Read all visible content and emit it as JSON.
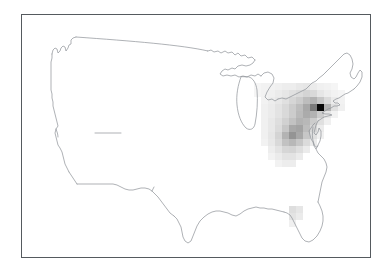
{
  "figure": {
    "title": "",
    "background_color": "#ffffff",
    "frame_color": "#555a5e",
    "outline_color": "#8d9196",
    "width": 389,
    "height": 272
  },
  "map": {
    "region_label": "Contiguous United States",
    "projection": "albers-equal-area",
    "frame": {
      "x": 21,
      "y": 14,
      "width": 350,
      "height": 244
    }
  },
  "chart_data": {
    "type": "heatmap",
    "title": "",
    "subtitle": "",
    "xlabel": "",
    "ylabel": "",
    "grid": false,
    "legend": "none",
    "colormap": "Greys",
    "value_range": [
      0,
      1
    ],
    "cell_size_px": 7,
    "cells": [
      {
        "x": 253,
        "y": 82,
        "v": 0.04
      },
      {
        "x": 260,
        "y": 82,
        "v": 0.05
      },
      {
        "x": 267,
        "y": 82,
        "v": 0.05
      },
      {
        "x": 274,
        "y": 82,
        "v": 0.06
      },
      {
        "x": 281,
        "y": 82,
        "v": 0.07
      },
      {
        "x": 288,
        "y": 82,
        "v": 0.07
      },
      {
        "x": 295,
        "y": 82,
        "v": 0.09
      },
      {
        "x": 302,
        "y": 82,
        "v": 0.1
      },
      {
        "x": 309,
        "y": 82,
        "v": 0.08
      },
      {
        "x": 316,
        "y": 82,
        "v": 0.06
      },
      {
        "x": 323,
        "y": 82,
        "v": 0.05
      },
      {
        "x": 330,
        "y": 82,
        "v": 0.04
      },
      {
        "x": 253,
        "y": 89,
        "v": 0.04
      },
      {
        "x": 260,
        "y": 89,
        "v": 0.05
      },
      {
        "x": 267,
        "y": 89,
        "v": 0.06
      },
      {
        "x": 274,
        "y": 89,
        "v": 0.08
      },
      {
        "x": 281,
        "y": 89,
        "v": 0.1
      },
      {
        "x": 288,
        "y": 89,
        "v": 0.12
      },
      {
        "x": 295,
        "y": 89,
        "v": 0.14
      },
      {
        "x": 302,
        "y": 89,
        "v": 0.17
      },
      {
        "x": 309,
        "y": 89,
        "v": 0.15
      },
      {
        "x": 316,
        "y": 89,
        "v": 0.1
      },
      {
        "x": 323,
        "y": 89,
        "v": 0.07
      },
      {
        "x": 330,
        "y": 89,
        "v": 0.05
      },
      {
        "x": 337,
        "y": 89,
        "v": 0.04
      },
      {
        "x": 260,
        "y": 96,
        "v": 0.05
      },
      {
        "x": 267,
        "y": 96,
        "v": 0.07
      },
      {
        "x": 274,
        "y": 96,
        "v": 0.09
      },
      {
        "x": 281,
        "y": 96,
        "v": 0.12
      },
      {
        "x": 288,
        "y": 96,
        "v": 0.16
      },
      {
        "x": 295,
        "y": 96,
        "v": 0.2
      },
      {
        "x": 302,
        "y": 96,
        "v": 0.26
      },
      {
        "x": 309,
        "y": 96,
        "v": 0.3
      },
      {
        "x": 316,
        "y": 96,
        "v": 0.22
      },
      {
        "x": 323,
        "y": 96,
        "v": 0.14
      },
      {
        "x": 330,
        "y": 96,
        "v": 0.08
      },
      {
        "x": 337,
        "y": 96,
        "v": 0.05
      },
      {
        "x": 260,
        "y": 103,
        "v": 0.06
      },
      {
        "x": 267,
        "y": 103,
        "v": 0.08
      },
      {
        "x": 274,
        "y": 103,
        "v": 0.11
      },
      {
        "x": 281,
        "y": 103,
        "v": 0.15
      },
      {
        "x": 288,
        "y": 103,
        "v": 0.2
      },
      {
        "x": 295,
        "y": 103,
        "v": 0.26
      },
      {
        "x": 302,
        "y": 103,
        "v": 0.34
      },
      {
        "x": 309,
        "y": 103,
        "v": 0.52
      },
      {
        "x": 316,
        "y": 103,
        "v": 0.97
      },
      {
        "x": 323,
        "y": 103,
        "v": 0.3
      },
      {
        "x": 330,
        "y": 103,
        "v": 0.12
      },
      {
        "x": 337,
        "y": 103,
        "v": 0.06
      },
      {
        "x": 260,
        "y": 110,
        "v": 0.06
      },
      {
        "x": 267,
        "y": 110,
        "v": 0.08
      },
      {
        "x": 274,
        "y": 110,
        "v": 0.11
      },
      {
        "x": 281,
        "y": 110,
        "v": 0.15
      },
      {
        "x": 288,
        "y": 110,
        "v": 0.2
      },
      {
        "x": 295,
        "y": 110,
        "v": 0.27
      },
      {
        "x": 302,
        "y": 110,
        "v": 0.33
      },
      {
        "x": 309,
        "y": 110,
        "v": 0.3
      },
      {
        "x": 316,
        "y": 110,
        "v": 0.2
      },
      {
        "x": 323,
        "y": 110,
        "v": 0.1
      },
      {
        "x": 330,
        "y": 110,
        "v": 0.05
      },
      {
        "x": 260,
        "y": 117,
        "v": 0.06
      },
      {
        "x": 267,
        "y": 117,
        "v": 0.09
      },
      {
        "x": 274,
        "y": 117,
        "v": 0.13
      },
      {
        "x": 281,
        "y": 117,
        "v": 0.18
      },
      {
        "x": 288,
        "y": 117,
        "v": 0.24
      },
      {
        "x": 295,
        "y": 117,
        "v": 0.3
      },
      {
        "x": 302,
        "y": 117,
        "v": 0.28
      },
      {
        "x": 309,
        "y": 117,
        "v": 0.2
      },
      {
        "x": 316,
        "y": 117,
        "v": 0.12
      },
      {
        "x": 323,
        "y": 117,
        "v": 0.06
      },
      {
        "x": 260,
        "y": 124,
        "v": 0.06
      },
      {
        "x": 267,
        "y": 124,
        "v": 0.09
      },
      {
        "x": 274,
        "y": 124,
        "v": 0.14
      },
      {
        "x": 281,
        "y": 124,
        "v": 0.22
      },
      {
        "x": 288,
        "y": 124,
        "v": 0.34
      },
      {
        "x": 295,
        "y": 124,
        "v": 0.36
      },
      {
        "x": 302,
        "y": 124,
        "v": 0.26
      },
      {
        "x": 309,
        "y": 124,
        "v": 0.16
      },
      {
        "x": 316,
        "y": 124,
        "v": 0.08
      },
      {
        "x": 260,
        "y": 131,
        "v": 0.06
      },
      {
        "x": 267,
        "y": 131,
        "v": 0.1
      },
      {
        "x": 274,
        "y": 131,
        "v": 0.17
      },
      {
        "x": 281,
        "y": 131,
        "v": 0.3
      },
      {
        "x": 288,
        "y": 131,
        "v": 0.42
      },
      {
        "x": 295,
        "y": 131,
        "v": 0.34
      },
      {
        "x": 302,
        "y": 131,
        "v": 0.22
      },
      {
        "x": 309,
        "y": 131,
        "v": 0.12
      },
      {
        "x": 316,
        "y": 131,
        "v": 0.06
      },
      {
        "x": 260,
        "y": 138,
        "v": 0.05
      },
      {
        "x": 267,
        "y": 138,
        "v": 0.09
      },
      {
        "x": 274,
        "y": 138,
        "v": 0.15
      },
      {
        "x": 281,
        "y": 138,
        "v": 0.24
      },
      {
        "x": 288,
        "y": 138,
        "v": 0.28
      },
      {
        "x": 295,
        "y": 138,
        "v": 0.22
      },
      {
        "x": 302,
        "y": 138,
        "v": 0.14
      },
      {
        "x": 309,
        "y": 138,
        "v": 0.08
      },
      {
        "x": 267,
        "y": 145,
        "v": 0.07
      },
      {
        "x": 274,
        "y": 145,
        "v": 0.11
      },
      {
        "x": 281,
        "y": 145,
        "v": 0.16
      },
      {
        "x": 288,
        "y": 145,
        "v": 0.17
      },
      {
        "x": 295,
        "y": 145,
        "v": 0.13
      },
      {
        "x": 302,
        "y": 145,
        "v": 0.08
      },
      {
        "x": 267,
        "y": 152,
        "v": 0.05
      },
      {
        "x": 274,
        "y": 152,
        "v": 0.08
      },
      {
        "x": 281,
        "y": 152,
        "v": 0.11
      },
      {
        "x": 288,
        "y": 152,
        "v": 0.11
      },
      {
        "x": 295,
        "y": 152,
        "v": 0.08
      },
      {
        "x": 274,
        "y": 159,
        "v": 0.05
      },
      {
        "x": 281,
        "y": 159,
        "v": 0.07
      },
      {
        "x": 288,
        "y": 159,
        "v": 0.07
      },
      {
        "x": 288,
        "y": 205,
        "v": 0.13
      },
      {
        "x": 295,
        "y": 205,
        "v": 0.1
      },
      {
        "x": 288,
        "y": 212,
        "v": 0.11
      },
      {
        "x": 295,
        "y": 212,
        "v": 0.08
      },
      {
        "x": 288,
        "y": 219,
        "v": 0.06
      }
    ]
  }
}
